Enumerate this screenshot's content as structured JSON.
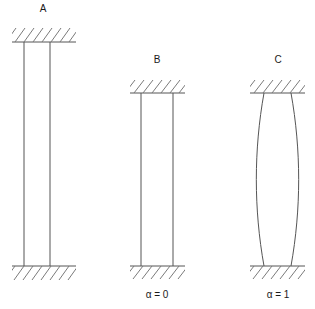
{
  "figure": {
    "type": "diagram",
    "background_color": "#ffffff",
    "line_color": "#555555",
    "hatch_color": "#7a7a7a",
    "text_color": "#1a1a1a",
    "width": 315,
    "height": 309
  },
  "columns": [
    {
      "id": "A",
      "label": "A",
      "label_x": 43,
      "label_y": 12,
      "alpha_label": "",
      "alpha_x": 43,
      "alpha_y": 298,
      "shaft_left_x": 24,
      "shaft_right_x": 50,
      "top_y": 42,
      "bottom_y": 266,
      "bulge": 0,
      "top_support": {
        "x1": 12,
        "x2": 76,
        "y": 42,
        "hatch_side": "above",
        "hatch_depth": 14
      },
      "bottom_support": {
        "x1": 12,
        "x2": 76,
        "y": 266,
        "hatch_side": "below",
        "hatch_depth": 14
      }
    },
    {
      "id": "B",
      "label": "B",
      "label_x": 157,
      "label_y": 63,
      "alpha_label": "α = 0",
      "alpha_x": 157,
      "alpha_y": 298,
      "shaft_left_x": 141,
      "shaft_right_x": 173,
      "top_y": 93,
      "bottom_y": 266,
      "bulge": 0,
      "top_support": {
        "x1": 130,
        "x2": 185,
        "y": 93,
        "hatch_side": "above",
        "hatch_depth": 13
      },
      "bottom_support": {
        "x1": 130,
        "x2": 185,
        "y": 266,
        "hatch_side": "below",
        "hatch_depth": 13
      }
    },
    {
      "id": "C",
      "label": "C",
      "label_x": 278,
      "label_y": 63,
      "alpha_label": "α = 1",
      "alpha_x": 278,
      "alpha_y": 298,
      "shaft_left_x": 264,
      "shaft_right_x": 291,
      "top_y": 93,
      "bottom_y": 266,
      "bulge": 8,
      "top_support": {
        "x1": 250,
        "x2": 305,
        "y": 93,
        "hatch_side": "above",
        "hatch_depth": 13
      },
      "bottom_support": {
        "x1": 250,
        "x2": 305,
        "y": 266,
        "hatch_side": "below",
        "hatch_depth": 13
      }
    }
  ],
  "hatching": {
    "spacing": 9,
    "slope_dx": 10,
    "direction": "lower-left-to-upper-right"
  }
}
